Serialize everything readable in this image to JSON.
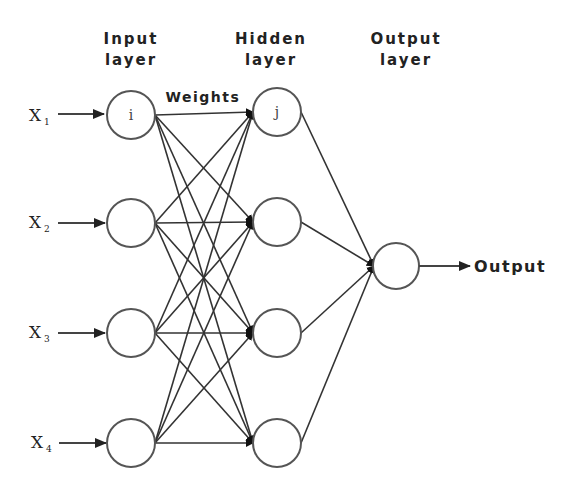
{
  "diagram": {
    "title_layers": {
      "input": [
        "Input",
        "layer"
      ],
      "hidden": [
        "Hidden",
        "layer"
      ],
      "output": [
        "Output",
        "layer"
      ]
    },
    "weights_label": "Weights",
    "output_label": "Output",
    "inputs": [
      {
        "symbol": "X",
        "subscript": "1"
      },
      {
        "symbol": "X",
        "subscript": "2"
      },
      {
        "symbol": "X",
        "subscript": "3"
      },
      {
        "symbol": "X",
        "subscript": "4"
      }
    ],
    "input_node_label": "i",
    "hidden_node_label": "j",
    "layers": {
      "input": {
        "count": 4
      },
      "hidden": {
        "count": 4
      },
      "output": {
        "count": 1
      }
    },
    "connectivity": "fully-connected",
    "colors": {
      "background": "#ffffff",
      "stroke": "#333333",
      "node_stroke": "#555555",
      "text": "#222222"
    }
  }
}
